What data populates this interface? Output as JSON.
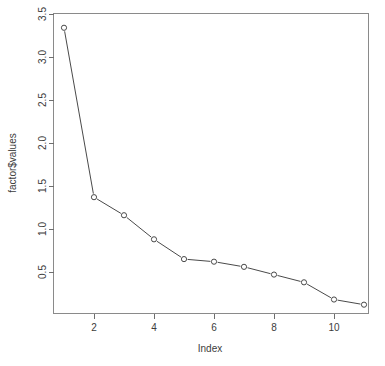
{
  "chart_data": {
    "type": "line",
    "title": "",
    "xlabel": "Index",
    "ylabel": "factor$values",
    "x": [
      1,
      2,
      3,
      4,
      5,
      6,
      7,
      8,
      9,
      10,
      11
    ],
    "values": [
      3.34,
      1.37,
      1.16,
      0.88,
      0.65,
      0.62,
      0.56,
      0.47,
      0.38,
      0.18,
      0.12
    ],
    "series": [
      {
        "name": "factor$values",
        "values": [
          3.34,
          1.37,
          1.16,
          0.88,
          0.65,
          0.62,
          0.56,
          0.47,
          0.38,
          0.18,
          0.12
        ]
      }
    ],
    "xlim": [
      0.6,
      11.4
    ],
    "ylim": [
      0.1,
      3.45
    ],
    "xticks": [
      2,
      4,
      6,
      8,
      10
    ],
    "xtick_labels": [
      "2",
      "4",
      "6",
      "8",
      "10"
    ],
    "yticks": [
      0.5,
      1.0,
      1.5,
      2.0,
      2.5,
      3.0,
      3.5
    ],
    "ytick_labels": [
      "0.5",
      "1.0",
      "1.5",
      "2.0",
      "2.5",
      "3.0",
      "3.5"
    ],
    "grid": false,
    "legend": "none",
    "marker": "open-circle",
    "line_color": "#4a4a4a",
    "marker_color": "#4a4a4a",
    "background_color": "#ffffff",
    "axis_color": "#6e6e6e"
  },
  "axes": {
    "y_title": "factor$values",
    "x_title": "Index"
  },
  "ghost": {
    "clipped_header_text": ""
  }
}
